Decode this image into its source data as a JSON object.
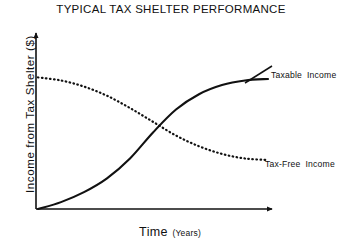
{
  "chart_data": {
    "type": "line",
    "title": "TYPICAL TAX SHELTER PERFORMANCE",
    "xlabel_main": "Time",
    "xlabel_unit": "(Years)",
    "ylabel": "Income from Tax Shelter ($)",
    "grid": false,
    "legend_position": "inline-right",
    "axis_style": "arrow-headed L-axes, no tick marks, no numeric scale",
    "xlim": [
      0,
      10
    ],
    "ylim": [
      0,
      10
    ],
    "x": [
      0,
      1,
      2,
      3,
      4,
      5,
      6,
      7,
      8,
      9,
      10
    ],
    "series": [
      {
        "name": "Taxable Income",
        "style": "solid",
        "color": "#111111",
        "values": [
          0.0,
          0.45,
          1.1,
          2.0,
          3.3,
          5.0,
          6.5,
          7.5,
          8.1,
          8.4,
          8.5
        ]
      },
      {
        "name": "Tax-Free Income",
        "style": "dotted",
        "color": "#111111",
        "values": [
          8.6,
          8.4,
          8.0,
          7.4,
          6.6,
          5.7,
          4.8,
          4.1,
          3.6,
          3.3,
          3.2
        ]
      }
    ],
    "annotations": [
      {
        "text": "Taxable Income",
        "target_series": "Taxable Income",
        "leader_line": true
      },
      {
        "text": "Tax-Free Income",
        "target_series": "Tax-Free Income",
        "leader_line": false
      }
    ],
    "crossover_note": "Curves intersect near the middle of the time range"
  },
  "labels": {
    "taxable_a": "Taxable",
    "taxable_b": "Income",
    "taxfree_a": "Tax-Free",
    "taxfree_b": "Income"
  },
  "colors": {
    "ink": "#111111",
    "background": "#ffffff"
  }
}
